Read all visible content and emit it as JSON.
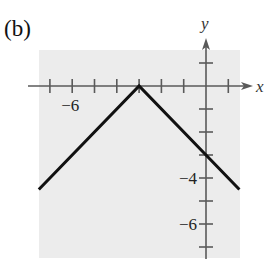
{
  "panel_label": "(b)",
  "colors": {
    "grid_background": "#ececec",
    "axis": "#5a5a5a",
    "curve": "#111111"
  },
  "chart_data": {
    "type": "line",
    "title": "",
    "panel": "(b)",
    "function": "y = -|x + 3|",
    "xlabel": "x",
    "ylabel": "y",
    "xlim": [
      -7.5,
      1.5
    ],
    "ylim": [
      -7.5,
      1.5
    ],
    "x_ticks": [
      -7,
      -6,
      -5,
      -4,
      -3,
      -2,
      -1,
      1
    ],
    "y_ticks": [
      1,
      -1,
      -2,
      -3,
      -4,
      -5,
      -6,
      -7
    ],
    "x_tick_labels": [
      {
        "value": -6,
        "text": "−6"
      }
    ],
    "y_tick_labels": [
      {
        "value": -4,
        "text": "−4"
      },
      {
        "value": -6,
        "text": "−6"
      }
    ],
    "grid": false,
    "series": [
      {
        "name": "y = -|x+3|",
        "points": [
          [
            -7.5,
            -4.5
          ],
          [
            -3,
            0
          ],
          [
            1.5,
            -4.5
          ]
        ]
      }
    ]
  }
}
